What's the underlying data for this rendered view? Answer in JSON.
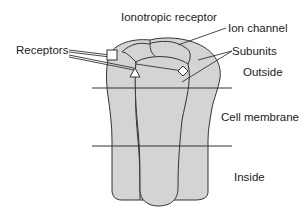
{
  "diagram": {
    "title": "Ionotropic receptor",
    "labels": {
      "receptors": "Receptors",
      "ion_channel": "Ion channel",
      "subunits": "Subunits",
      "outside": "Outside",
      "cell_membrane": "Cell membrane",
      "inside": "Inside"
    },
    "colors": {
      "fill": "#d4d4d4",
      "stroke": "#333333",
      "text": "#222222"
    }
  }
}
